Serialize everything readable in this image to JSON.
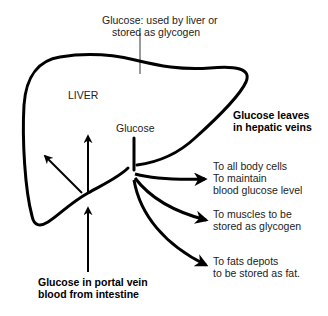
{
  "diagram": {
    "organ_label": "LIVER",
    "top_note": {
      "line1": "Glucose: used by liver or",
      "line2": "stored as glycogen"
    },
    "center_label": "Glucose",
    "hepatic_veins": {
      "line1": "Glucose leaves",
      "line2": "in hepatic veins"
    },
    "portal_vein": {
      "line1": "Glucose in portal vein",
      "line2": "blood from intestine"
    },
    "destinations": [
      {
        "line1": "To all body cells",
        "line2": "To maintain",
        "line3": "blood glucose level"
      },
      {
        "line1": "To muscles to be",
        "line2": "stored as glycogen"
      },
      {
        "line1": "To fats depots",
        "line2": "to be stored as fat."
      }
    ],
    "colors": {
      "stroke": "#000000",
      "background": "#ffffff"
    }
  }
}
